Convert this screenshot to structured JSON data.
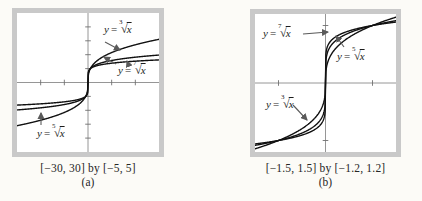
{
  "figure": {
    "description_visible_text_only": true
  },
  "panels": [
    {
      "caption": "[−30, 30] by [−5, 5]",
      "tag": "(a)",
      "labels": {
        "cube": {
          "var": "y",
          "eq": "=",
          "index": "3",
          "radical": "√",
          "radicand": "x"
        },
        "seventh": {
          "var": "y",
          "eq": "=",
          "index": "7",
          "radical": "√",
          "radicand": "x"
        },
        "fifth": {
          "var": "y",
          "eq": "=",
          "index": "5",
          "radical": "√",
          "radicand": "x"
        }
      }
    },
    {
      "caption": "[−1.5, 1.5] by [−1.2, 1.2]",
      "tag": "(b)",
      "labels": {
        "seventh": {
          "var": "y",
          "eq": "=",
          "index": "7",
          "radical": "√",
          "radicand": "x"
        },
        "fifth": {
          "var": "y",
          "eq": "=",
          "index": "5",
          "radical": "√",
          "radicand": "x"
        },
        "cube": {
          "var": "y",
          "eq": "=",
          "index": "3",
          "radical": "√",
          "radicand": "x"
        }
      }
    }
  ],
  "colors": {
    "frame": "#c9c9c9",
    "curve": "#111111",
    "axis": "#8a8a8a",
    "arrow": "#5a5a5a",
    "paper": "#ffffff"
  },
  "chart_data": [
    {
      "type": "line",
      "title": "Odd root functions y = x^(1/n), viewing window (a)",
      "window_label": "[−30, 30] by [−5, 5]",
      "xlim": [
        -30,
        30
      ],
      "ylim": [
        -5,
        5
      ],
      "x_tick_step": 10,
      "y_tick_step": 1,
      "grid": false,
      "legend": "inline curve labels with arrows",
      "series": [
        {
          "name": "y = 3rd root of x",
          "root_index": 3
        },
        {
          "name": "y = 5th root of x",
          "root_index": 5
        },
        {
          "name": "y = 7th root of x",
          "root_index": 7
        }
      ]
    },
    {
      "type": "line",
      "title": "Odd root functions y = x^(1/n), viewing window (b)",
      "window_label": "[−1.5, 1.5] by [−1.2, 1.2]",
      "xlim": [
        -1.5,
        1.5
      ],
      "ylim": [
        -1.2,
        1.2
      ],
      "x_tick_step": 1,
      "y_tick_step": 1,
      "grid": false,
      "legend": "inline curve labels with arrows",
      "series": [
        {
          "name": "y = 3rd root of x",
          "root_index": 3
        },
        {
          "name": "y = 5th root of x",
          "root_index": 5
        },
        {
          "name": "y = 7th root of x",
          "root_index": 7
        }
      ]
    }
  ]
}
